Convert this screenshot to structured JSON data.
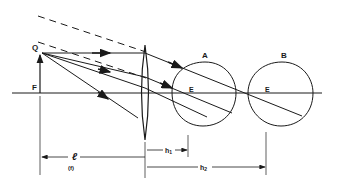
{
  "diagram": {
    "labels": {
      "Q": "Q",
      "F": "F",
      "A": "A",
      "B": "B",
      "E_A": "E",
      "E_B": "E",
      "ell": "ℓ",
      "f": "(f)",
      "h1": "h",
      "h1_sub": "1",
      "h2": "h",
      "h2_sub": "2"
    },
    "colors": {
      "ink": "#1a1a1a",
      "background": "#ffffff"
    }
  }
}
